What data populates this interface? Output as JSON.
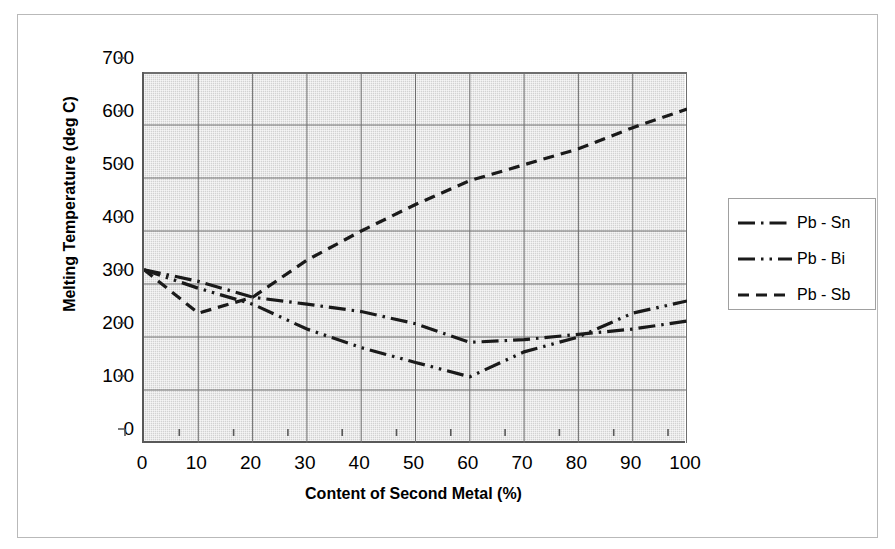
{
  "chart_data": {
    "type": "line",
    "title": "",
    "xlabel": "Content of Second Metal (%)",
    "ylabel": "Melting Temperature (deg C)",
    "xlim": [
      0,
      100
    ],
    "ylim": [
      0,
      700
    ],
    "x_ticks": [
      "0",
      "10",
      "20",
      "30",
      "40",
      "50",
      "60",
      "70",
      "80",
      "90",
      "100"
    ],
    "y_ticks": [
      "0",
      "100",
      "200",
      "300",
      "400",
      "500",
      "600",
      "700"
    ],
    "grid": true,
    "legend_position": "right",
    "x": [
      0,
      10,
      20,
      30,
      40,
      50,
      60,
      70,
      80,
      90,
      100
    ],
    "series": [
      {
        "name": "Pb - Sn",
        "dash_style": "dash-dot",
        "color": "#1a1a1a",
        "values": [
          327,
          305,
          275,
          262,
          248,
          225,
          190,
          195,
          205,
          215,
          230
        ]
      },
      {
        "name": "Pb - Bi",
        "dash_style": "dash-dot-dot",
        "color": "#1a1a1a",
        "values": [
          327,
          292,
          262,
          215,
          180,
          152,
          125,
          172,
          200,
          245,
          268
        ]
      },
      {
        "name": "Pb - Sb",
        "dash_style": "dashed",
        "color": "#1a1a1a",
        "values": [
          327,
          245,
          275,
          345,
          400,
          450,
          495,
          525,
          555,
          595,
          630
        ]
      }
    ]
  },
  "axis": {
    "y_title": "Melting Temperature (deg C)",
    "x_title": "Content of Second Metal (%)"
  },
  "legend": {
    "entries": [
      {
        "label": "Pb - Sn",
        "style": "dash-dot"
      },
      {
        "label": "Pb - Bi",
        "style": "dash-dot-dot"
      },
      {
        "label": "Pb - Sb",
        "style": "dashed"
      }
    ]
  },
  "style": {
    "plot_background": "#d2d2d2",
    "axis_color": "#595959",
    "gridline_color": "#6e6e6e",
    "series_color": "#1a1a1a",
    "frame_color": "#b9b9b9"
  }
}
